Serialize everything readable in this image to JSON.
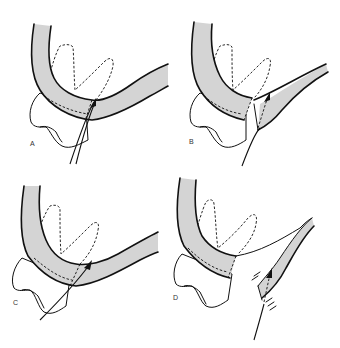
{
  "figure": {
    "panels": [
      {
        "id": "A",
        "label": "A",
        "variant": "incision-through-mucoperiosteum"
      },
      {
        "id": "B",
        "label": "B",
        "variant": "flap-partially-reflected"
      },
      {
        "id": "C",
        "label": "C",
        "variant": "incision-along-tooth"
      },
      {
        "id": "D",
        "label": "D",
        "variant": "flap-fully-reflected"
      }
    ],
    "colors": {
      "tissue_fill": "#d4d4d4",
      "outline": "#111111",
      "background": "#ffffff"
    },
    "icons": {
      "arrow": "instrument-arrow",
      "tooth": "molar-outline",
      "roots": "dashed-root-outline"
    }
  }
}
